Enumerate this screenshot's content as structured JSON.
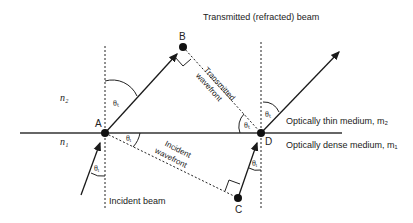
{
  "labels": {
    "transmitted_beam": "Transmitted (refracted) beam",
    "transmitted_wavefront_1": "Transmitted",
    "transmitted_wavefront_2": "wavefront",
    "incident_wavefront_1": "Incident",
    "incident_wavefront_2": "wavefront",
    "incident_beam": "Incident beam",
    "thin_medium": "Optically thin medium, m₂",
    "dense_medium": "Optically dense medium, m₁",
    "n2": "n₂",
    "n1": "n₁"
  },
  "points": {
    "A": "A",
    "B": "B",
    "C": "C",
    "D": "D"
  },
  "angles": {
    "theta_t": "θₜ",
    "theta_i": "θᵢ"
  },
  "colors": {
    "line": "#1a1a1a",
    "background": "#ffffff"
  }
}
